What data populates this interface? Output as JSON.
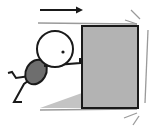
{
  "illustration": {
    "subject": "stick-figure-pushing-box",
    "direction": "right",
    "colors": {
      "background": "#ffffff",
      "outline": "#1a1a1a",
      "box_fill": "#b3b3b3",
      "body_fill": "#6e6e6e",
      "motion_lines": "#9a9a9a",
      "ground_wedge": "#c4c4c4"
    }
  }
}
